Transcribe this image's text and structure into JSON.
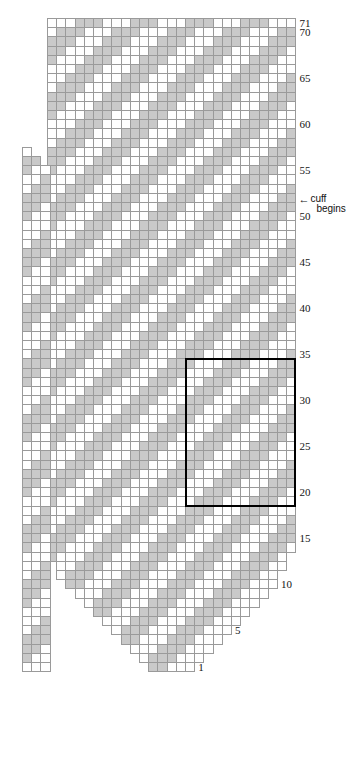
{
  "chart": {
    "type": "colorwork-grid",
    "columns": 27,
    "rows": 71,
    "cell_px": 9.2,
    "origin": {
      "x": 47,
      "y": 18
    },
    "colors": {
      "background_stitch": "#ffffff",
      "foreground_stitch": "#c9c9c9",
      "gridline": "#9a9a9a",
      "repeat_outline": "#000000",
      "label_text": "#141414"
    },
    "row_labels": [
      {
        "row": 71,
        "text": "71"
      },
      {
        "row": 70,
        "text": "70"
      },
      {
        "row": 65,
        "text": "65"
      },
      {
        "row": 60,
        "text": "60"
      },
      {
        "row": 55,
        "text": "55"
      },
      {
        "row": 50,
        "text": "50"
      },
      {
        "row": 45,
        "text": "45"
      },
      {
        "row": 40,
        "text": "40"
      },
      {
        "row": 35,
        "text": "35"
      },
      {
        "row": 30,
        "text": "30"
      },
      {
        "row": 25,
        "text": "25"
      },
      {
        "row": 20,
        "text": "20"
      },
      {
        "row": 15,
        "text": "15"
      },
      {
        "row": 10,
        "text": "10"
      },
      {
        "row": 5,
        "text": "5"
      },
      {
        "row": 1,
        "text": "1"
      }
    ],
    "annotations": [
      {
        "name": "cuff-begins",
        "arrow": "←",
        "line1": "cuff",
        "line2": "begins",
        "at_row": 52
      }
    ],
    "repeat_box": {
      "label": "pattern repeat",
      "col_start": 15,
      "col_end": 27,
      "row_start": 19,
      "row_end": 34
    },
    "gusset": {
      "label": "thumb gusset panel",
      "columns": 3,
      "row_start": 1,
      "row_end": 57
    },
    "row_extents": [
      {
        "row": 71,
        "start": 0,
        "end": 27,
        "gstart": null,
        "gend": null
      },
      {
        "row": 70,
        "start": 0,
        "end": 27,
        "gstart": null,
        "gend": null
      },
      {
        "row": 69,
        "start": 0,
        "end": 27,
        "gstart": null,
        "gend": null
      },
      {
        "row": 68,
        "start": 0,
        "end": 27,
        "gstart": null,
        "gend": null
      },
      {
        "row": 67,
        "start": 0,
        "end": 27,
        "gstart": null,
        "gend": null
      },
      {
        "row": 66,
        "start": 0,
        "end": 27,
        "gstart": null,
        "gend": null
      },
      {
        "row": 65,
        "start": 0,
        "end": 27,
        "gstart": null,
        "gend": null
      },
      {
        "row": 64,
        "start": 0,
        "end": 27,
        "gstart": null,
        "gend": null
      },
      {
        "row": 63,
        "start": 0,
        "end": 27,
        "gstart": null,
        "gend": null
      },
      {
        "row": 62,
        "start": 0,
        "end": 27,
        "gstart": null,
        "gend": null
      },
      {
        "row": 61,
        "start": 0,
        "end": 27,
        "gstart": null,
        "gend": null
      },
      {
        "row": 60,
        "start": 0,
        "end": 27,
        "gstart": null,
        "gend": null
      },
      {
        "row": 59,
        "start": 0,
        "end": 27,
        "gstart": null,
        "gend": null
      },
      {
        "row": 58,
        "start": 0,
        "end": 27,
        "gstart": null,
        "gend": null
      },
      {
        "row": 57,
        "start": 0,
        "end": 27,
        "gstart": 0,
        "gend": 1
      },
      {
        "row": 56,
        "start": 0,
        "end": 27,
        "gstart": 0,
        "gend": 2
      },
      {
        "row": 55,
        "start": 0,
        "end": 27,
        "gstart": 0,
        "gend": 3
      },
      {
        "row": 54,
        "start": 0,
        "end": 27,
        "gstart": 0,
        "gend": 3
      },
      {
        "row": 53,
        "start": 0,
        "end": 27,
        "gstart": 0,
        "gend": 3
      },
      {
        "row": 52,
        "start": 0,
        "end": 27,
        "gstart": 0,
        "gend": 3
      },
      {
        "row": 51,
        "start": 0,
        "end": 27,
        "gstart": 0,
        "gend": 3
      },
      {
        "row": 50,
        "start": 0,
        "end": 27,
        "gstart": 0,
        "gend": 3
      },
      {
        "row": 49,
        "start": 0,
        "end": 27,
        "gstart": 0,
        "gend": 3
      },
      {
        "row": 48,
        "start": 0,
        "end": 27,
        "gstart": 0,
        "gend": 3
      },
      {
        "row": 47,
        "start": 0,
        "end": 27,
        "gstart": 0,
        "gend": 3
      },
      {
        "row": 46,
        "start": 0,
        "end": 27,
        "gstart": 0,
        "gend": 3
      },
      {
        "row": 45,
        "start": 0,
        "end": 27,
        "gstart": 0,
        "gend": 3
      },
      {
        "row": 44,
        "start": 0,
        "end": 27,
        "gstart": 0,
        "gend": 3
      },
      {
        "row": 43,
        "start": 0,
        "end": 27,
        "gstart": 0,
        "gend": 3
      },
      {
        "row": 42,
        "start": 0,
        "end": 27,
        "gstart": 0,
        "gend": 3
      },
      {
        "row": 41,
        "start": 0,
        "end": 27,
        "gstart": 0,
        "gend": 3
      },
      {
        "row": 40,
        "start": 0,
        "end": 27,
        "gstart": 0,
        "gend": 3
      },
      {
        "row": 39,
        "start": 0,
        "end": 27,
        "gstart": 0,
        "gend": 3
      },
      {
        "row": 38,
        "start": 0,
        "end": 27,
        "gstart": 0,
        "gend": 3
      },
      {
        "row": 37,
        "start": 0,
        "end": 27,
        "gstart": 0,
        "gend": 3
      },
      {
        "row": 36,
        "start": 0,
        "end": 27,
        "gstart": 0,
        "gend": 3
      },
      {
        "row": 35,
        "start": 0,
        "end": 27,
        "gstart": 0,
        "gend": 3
      },
      {
        "row": 34,
        "start": 0,
        "end": 27,
        "gstart": 0,
        "gend": 3
      },
      {
        "row": 33,
        "start": 0,
        "end": 27,
        "gstart": 0,
        "gend": 3
      },
      {
        "row": 32,
        "start": 0,
        "end": 27,
        "gstart": 0,
        "gend": 3
      },
      {
        "row": 31,
        "start": 0,
        "end": 27,
        "gstart": 0,
        "gend": 3
      },
      {
        "row": 30,
        "start": 0,
        "end": 27,
        "gstart": 0,
        "gend": 3
      },
      {
        "row": 29,
        "start": 0,
        "end": 27,
        "gstart": 0,
        "gend": 3
      },
      {
        "row": 28,
        "start": 0,
        "end": 27,
        "gstart": 0,
        "gend": 3
      },
      {
        "row": 27,
        "start": 0,
        "end": 27,
        "gstart": 0,
        "gend": 3
      },
      {
        "row": 26,
        "start": 0,
        "end": 27,
        "gstart": 0,
        "gend": 3
      },
      {
        "row": 25,
        "start": 0,
        "end": 27,
        "gstart": 0,
        "gend": 3
      },
      {
        "row": 24,
        "start": 0,
        "end": 27,
        "gstart": 0,
        "gend": 3
      },
      {
        "row": 23,
        "start": 0,
        "end": 27,
        "gstart": 0,
        "gend": 3
      },
      {
        "row": 22,
        "start": 0,
        "end": 27,
        "gstart": 0,
        "gend": 3
      },
      {
        "row": 21,
        "start": 0,
        "end": 27,
        "gstart": 0,
        "gend": 3
      },
      {
        "row": 20,
        "start": 0,
        "end": 27,
        "gstart": 0,
        "gend": 3
      },
      {
        "row": 19,
        "start": 0,
        "end": 27,
        "gstart": 0,
        "gend": 3
      },
      {
        "row": 18,
        "start": 0,
        "end": 27,
        "gstart": 0,
        "gend": 3
      },
      {
        "row": 17,
        "start": 0,
        "end": 27,
        "gstart": 0,
        "gend": 3
      },
      {
        "row": 16,
        "start": 0,
        "end": 27,
        "gstart": 0,
        "gend": 3
      },
      {
        "row": 15,
        "start": 0,
        "end": 27,
        "gstart": 0,
        "gend": 3
      },
      {
        "row": 14,
        "start": 0,
        "end": 27,
        "gstart": 0,
        "gend": 3
      },
      {
        "row": 13,
        "start": 0,
        "end": 26,
        "gstart": 0,
        "gend": 3
      },
      {
        "row": 12,
        "start": 1,
        "end": 26,
        "gstart": 0,
        "gend": 3
      },
      {
        "row": 11,
        "start": 1,
        "end": 25,
        "gstart": 0,
        "gend": 3
      },
      {
        "row": 10,
        "start": 2,
        "end": 25,
        "gstart": 0,
        "gend": 3
      },
      {
        "row": 9,
        "start": 3,
        "end": 24,
        "gstart": 0,
        "gend": 3
      },
      {
        "row": 8,
        "start": 4,
        "end": 23,
        "gstart": 0,
        "gend": 3
      },
      {
        "row": 7,
        "start": 5,
        "end": 22,
        "gstart": 0,
        "gend": 3
      },
      {
        "row": 6,
        "start": 6,
        "end": 21,
        "gstart": 0,
        "gend": 3
      },
      {
        "row": 5,
        "start": 7,
        "end": 20,
        "gstart": 0,
        "gend": 3
      },
      {
        "row": 4,
        "start": 8,
        "end": 19,
        "gstart": 0,
        "gend": 3
      },
      {
        "row": 3,
        "start": 9,
        "end": 18,
        "gstart": 0,
        "gend": 3
      },
      {
        "row": 2,
        "start": 10,
        "end": 17,
        "gstart": 0,
        "gend": 3
      },
      {
        "row": 1,
        "start": 11,
        "end": 16,
        "gstart": 0,
        "gend": 3
      }
    ],
    "grid": [
      "000111000111000111000111000",
      "011100011100011100011100011",
      "111000111000111000111000111",
      "110001110001110001110001110",
      "100011100011100011100011100",
      "000111000111000111000111000",
      "001110001110001110001110001",
      "011100011100011100011100011",
      "111000111000111000111000111",
      "110001110001110001110001110",
      "100011100011100011100011100",
      "000111000111000111000111000",
      "001110001110001110001110001",
      "011100011100011100011100011",
      "111000111000111000111000111",
      "110001110001110001110001110",
      "100011100011100011100011100",
      "000111000111000111000111000",
      "001110001110001110001110001",
      "011100011100011100011100011",
      "111000111000111000111000111",
      "110001110001110001110001110",
      "100011100011100011100011100",
      "000111000111000111000111000",
      "001110001110001110001110001",
      "011100011100011100011100011",
      "111000111000111000111000111",
      "110001110001110001110001110",
      "100011100011100011100011100",
      "000111000111000111000111000",
      "001110001110001110001110001",
      "011100011100011100011100011",
      "111000111000111000111000111",
      "110001110001110001110001110",
      "100011100011100011100011100",
      "000111000111000111000111000",
      "001110001110001110001110001",
      "011100011100011100011100011",
      "111000111000111000111000111",
      "110001110001110001110001110",
      "100011100011100011100011100",
      "000111000111000111000111000",
      "001110001110001110001110001",
      "011100011100011100011100011",
      "111000111000111000111000111",
      "110001110001110001110001110",
      "100011100011100011100011100",
      "000111000111000111000111000",
      "001110001110001110001110001",
      "011100011100011100011100011",
      "111000111000111000111000111",
      "110001110001110001110001110",
      "100011100011100011100011100",
      "000111000111000111000111000",
      "001110001110001110001110001",
      "011100011100011100011100011",
      "111000111000111000111000111",
      "110001110001110001110001110",
      "100011100011100011100011100",
      "000111000111000111000111000",
      "001110001110001110001110001",
      "011100011100011100011100011",
      "111000111000111000111000111",
      "110001110001110001110001110",
      "100011100011100011100011100",
      "000111000111000111000111000",
      "001110001110001110001110001",
      "011100011100011100011100011",
      "111000111000111000111000111",
      "110001110001110001110001110",
      "100011100011100011100011100"
    ],
    "gusset_grid": [
      "011",
      "110",
      "100",
      "001",
      "011",
      "111",
      "110",
      "100",
      "000",
      "001",
      "011",
      "111",
      "110",
      "100",
      "000",
      "001",
      "011",
      "111",
      "110",
      "100",
      "000",
      "001",
      "011",
      "111",
      "110",
      "100",
      "000",
      "001",
      "011",
      "111",
      "110",
      "100",
      "000",
      "001",
      "011",
      "111",
      "110",
      "100",
      "000",
      "001",
      "011",
      "111",
      "110",
      "100",
      "000",
      "001",
      "011",
      "111",
      "110",
      "100",
      "000",
      "001",
      "011",
      "111",
      "110",
      "100",
      "000"
    ]
  }
}
